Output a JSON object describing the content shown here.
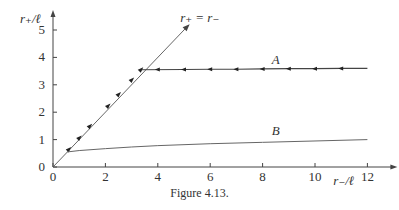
{
  "caption": "Figure 4.13.",
  "chart_data": {
    "type": "line",
    "title": "",
    "xlabel": "r₋/ℓ",
    "ylabel": "r₊/ℓ",
    "xlim": [
      0,
      12.8
    ],
    "ylim": [
      0,
      5.4
    ],
    "x_ticks": [
      0,
      2,
      4,
      6,
      8,
      10,
      12
    ],
    "y_ticks": [
      0,
      1,
      2,
      3,
      4,
      5
    ],
    "grid": false,
    "legend": "none",
    "series": [
      {
        "name": "r₊ = r₋",
        "label": "r₊ = r₋",
        "style": "diagonal line with arrow",
        "x": [
          0,
          5.1
        ],
        "y": [
          0,
          5.1
        ]
      },
      {
        "name": "A",
        "label": "A",
        "style": "line with leftward arrowheads; follows diagonal below kink",
        "x": [
          0.55,
          1.0,
          1.4,
          2.1,
          2.5,
          2.95,
          3.35,
          5,
          6,
          7,
          8,
          9,
          10,
          11,
          12
        ],
        "y": [
          0.55,
          1.0,
          1.4,
          2.1,
          2.5,
          2.95,
          3.55,
          3.56,
          3.57,
          3.57,
          3.58,
          3.59,
          3.59,
          3.6,
          3.6
        ],
        "arrow_markers_x": [
          0.6,
          1.0,
          1.4,
          2.1,
          2.5,
          3.0,
          3.35,
          4.0,
          5.0,
          6.0,
          7.0,
          8.0,
          9.0,
          10.0,
          11.0
        ]
      },
      {
        "name": "B",
        "label": "B",
        "style": "smooth curve",
        "x": [
          0.55,
          1,
          2,
          3,
          4,
          6,
          8,
          10,
          12
        ],
        "y": [
          0.55,
          0.6,
          0.67,
          0.73,
          0.78,
          0.85,
          0.9,
          0.95,
          1.0
        ]
      }
    ],
    "annotations": [
      {
        "text": "r₊ = r₋",
        "at": [
          5.6,
          5.3
        ]
      },
      {
        "text": "A",
        "at": [
          8.5,
          3.75
        ]
      },
      {
        "text": "B",
        "at": [
          8.5,
          1.15
        ]
      }
    ]
  }
}
